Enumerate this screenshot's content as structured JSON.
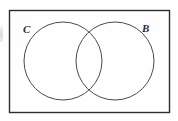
{
  "figure": {
    "kind": "venn-diagram",
    "universe_label": "",
    "background_color": "#fefefe",
    "stroke_color": "#4a4a4a",
    "rectangle_stroke_color": "#2d2d2d",
    "label_color": "#2a2a2a"
  },
  "rectangle": {
    "name": "universal-set-rectangle",
    "x": 9.5,
    "y": 10.5,
    "width": 160,
    "height": 102,
    "stroke_width": 1.4
  },
  "circles": [
    {
      "label": "C",
      "name": "circle-c",
      "cx": 63,
      "cy": 61,
      "r": 39,
      "stroke_width": 1.0
    },
    {
      "label": "B",
      "name": "circle-b",
      "cx": 115,
      "cy": 61,
      "r": 39,
      "stroke_width": 1.0
    }
  ],
  "labels": {
    "left_circle": "C",
    "right_circle": "B"
  },
  "chart_data": {
    "type": "diagram",
    "title": "",
    "sets": [
      "C",
      "B"
    ],
    "overlapping": true,
    "intersection_crossings": [
      {
        "x": 89,
        "y": 32
      },
      {
        "x": 89,
        "y": 90
      }
    ]
  }
}
